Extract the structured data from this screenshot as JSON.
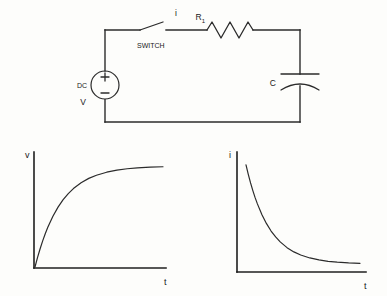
{
  "figure": {
    "background_color": "#fdfdfb",
    "ink_color": "#2b2b2b"
  },
  "circuit": {
    "name": "series RC circuit",
    "source": {
      "type_label": "DC",
      "value_label": "V",
      "plus_sign": "+",
      "minus_sign": "−"
    },
    "switch": {
      "label": "SWITCH",
      "state": "open"
    },
    "current_label": "i",
    "resistor": {
      "label": "R",
      "subscript": "1"
    },
    "capacitor": {
      "label": "C"
    }
  },
  "chart_data": [
    {
      "type": "line",
      "name": "capacitor-voltage-vs-time",
      "title": "",
      "xlabel": "t",
      "ylabel": "v",
      "grid": false,
      "legend": "none",
      "xlim": [
        0,
        5
      ],
      "ylim": [
        0,
        1.05
      ],
      "curve_equation": "v = V(1 - e^(-t/RC))",
      "x": [
        0,
        0.1,
        0.2,
        0.3,
        0.4,
        0.5,
        0.7,
        0.9,
        1.1,
        1.3,
        1.5,
        1.8,
        2.1,
        2.4,
        2.8,
        3.2,
        3.6,
        4.0,
        4.5,
        5.0
      ],
      "values": [
        0,
        0.095,
        0.181,
        0.259,
        0.33,
        0.393,
        0.503,
        0.593,
        0.667,
        0.727,
        0.777,
        0.835,
        0.878,
        0.909,
        0.939,
        0.959,
        0.973,
        0.982,
        0.989,
        0.993
      ]
    },
    {
      "type": "line",
      "name": "charging-current-vs-time",
      "title": "",
      "xlabel": "t",
      "ylabel": "i",
      "grid": false,
      "legend": "none",
      "xlim": [
        0,
        5
      ],
      "ylim": [
        0,
        1.05
      ],
      "curve_equation": "i = (V/R) e^(-t/RC)",
      "x": [
        0,
        0.1,
        0.2,
        0.3,
        0.4,
        0.5,
        0.7,
        0.9,
        1.1,
        1.3,
        1.5,
        1.8,
        2.1,
        2.4,
        2.8,
        3.2,
        3.6,
        4.0,
        4.5,
        5.0
      ],
      "values": [
        1.0,
        0.905,
        0.819,
        0.741,
        0.67,
        0.607,
        0.497,
        0.407,
        0.333,
        0.273,
        0.223,
        0.165,
        0.122,
        0.091,
        0.061,
        0.041,
        0.027,
        0.018,
        0.011,
        0.007
      ]
    }
  ]
}
